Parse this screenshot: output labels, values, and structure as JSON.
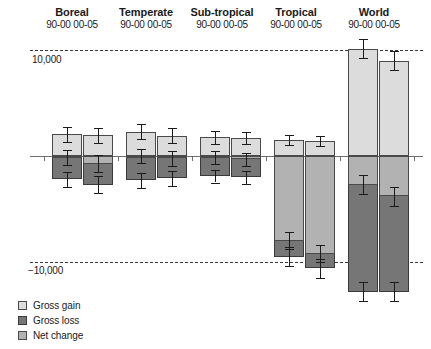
{
  "chart_data": {
    "type": "bar",
    "title": "",
    "xlabel": "",
    "ylabel": "1,000 ha/yr",
    "ylim": [
      -14000,
      12000
    ],
    "gridlines": [
      10000,
      -10000
    ],
    "gridline_labels": [
      "10,000",
      "−10,000"
    ],
    "zero_line": 0,
    "grid": true,
    "legend_position": "bottom-left",
    "categories": [
      "Boreal",
      "Temperate",
      "Sub-tropical",
      "Tropical",
      "World"
    ],
    "periods": [
      "90-00",
      "00-05"
    ],
    "series": [
      {
        "name": "Gross gain",
        "color": "#dcdcdc",
        "values": [
          [
            2050,
            1950
          ],
          [
            2300,
            1900
          ],
          [
            1750,
            1700
          ],
          [
            1500,
            1400
          ],
          [
            10100,
            9000
          ]
        ],
        "errors": [
          [
            700,
            700
          ],
          [
            700,
            700
          ],
          [
            600,
            600
          ],
          [
            500,
            500
          ],
          [
            900,
            900
          ]
        ]
      },
      {
        "name": "Gross loss",
        "color": "#767676",
        "values": [
          [
            -2200,
            -2700
          ],
          [
            -2300,
            -2100
          ],
          [
            -1900,
            -2000
          ],
          [
            -9500,
            -10600
          ],
          [
            -12800,
            -12800
          ]
        ],
        "errors": [
          [
            700,
            800
          ],
          [
            700,
            700
          ],
          [
            600,
            600
          ],
          [
            900,
            900
          ],
          [
            900,
            900
          ]
        ]
      },
      {
        "name": "Net change",
        "color": "#b2b2b2",
        "values": [
          [
            -150,
            -750
          ],
          [
            0,
            -200
          ],
          [
            -150,
            -300
          ],
          [
            -8000,
            -9200
          ],
          [
            -2700,
            -3800
          ]
        ],
        "errors": [
          [
            700,
            800
          ],
          [
            700,
            700
          ],
          [
            600,
            600
          ],
          [
            800,
            800
          ],
          [
            900,
            900
          ]
        ]
      }
    ]
  },
  "axis": {
    "y_title": "1,000 ha/yr",
    "gridline_top_label": "10,000",
    "gridline_bottom_label": "−10,000"
  },
  "groups": [
    {
      "name": "Boreal",
      "periods": "90-00 00-05"
    },
    {
      "name": "Temperate",
      "periods": "90-00 00-05"
    },
    {
      "name": "Sub-tropical",
      "periods": "90-00 00-05"
    },
    {
      "name": "Tropical",
      "periods": "90-00 00-05"
    },
    {
      "name": "World",
      "periods": "90-00 00-05"
    }
  ],
  "legend": {
    "items": [
      {
        "label": "Gross gain",
        "color": "#dcdcdc"
      },
      {
        "label": "Gross loss",
        "color": "#767676"
      },
      {
        "label": "Net change",
        "color": "#b2b2b2"
      }
    ]
  }
}
